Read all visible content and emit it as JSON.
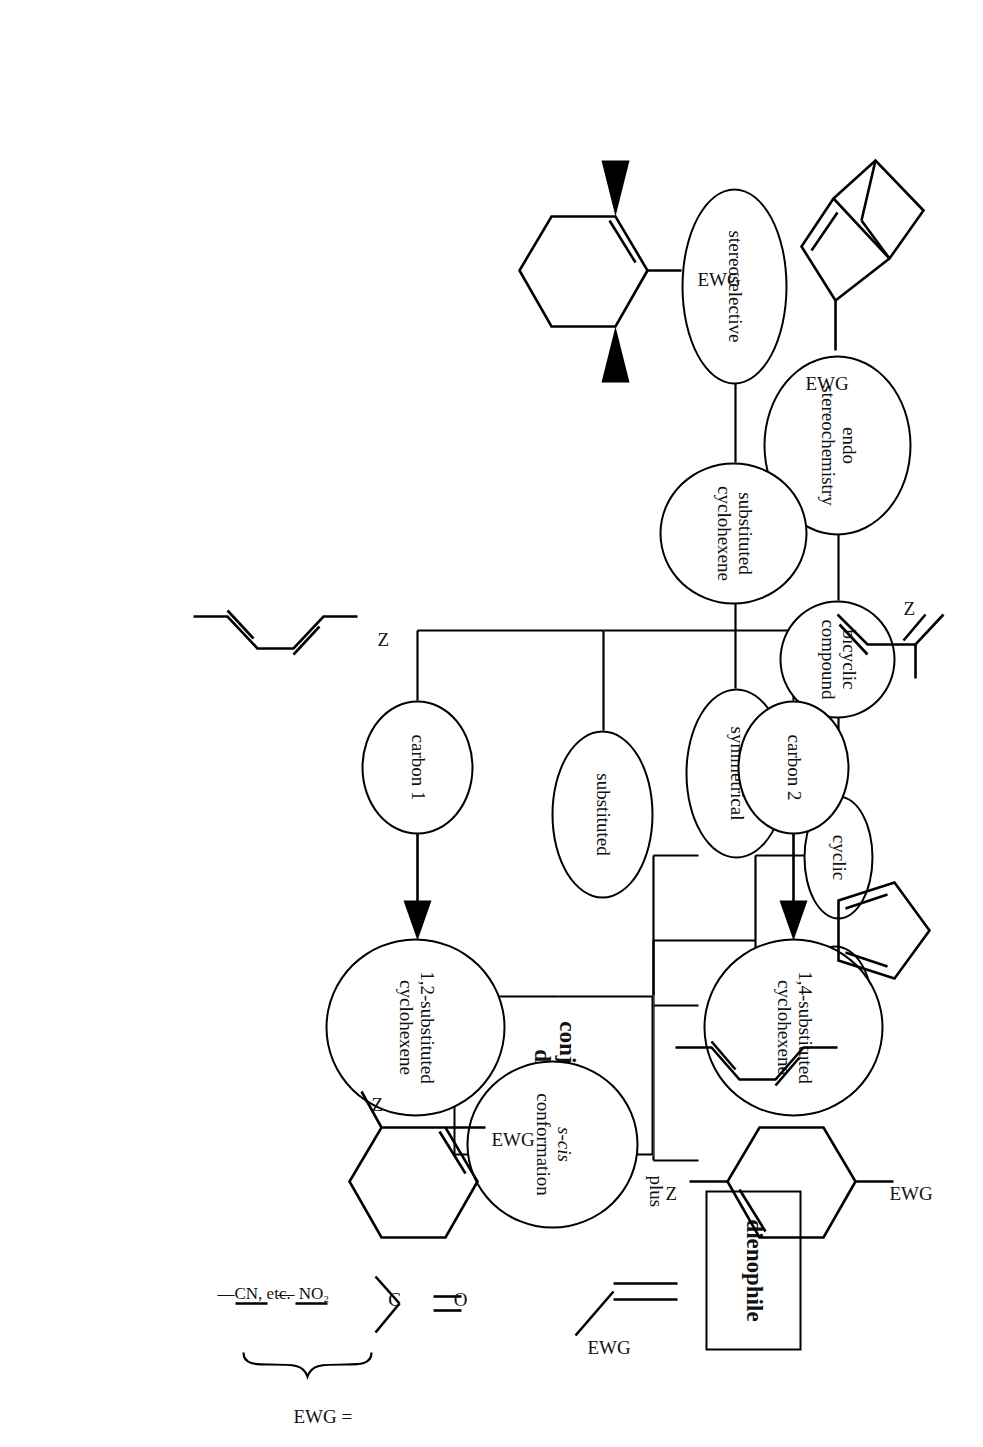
{
  "diagram": {
    "orientation_deg": 90,
    "background": "#ffffff",
    "line_color": "#000000"
  },
  "boxes": [
    {
      "id": "dienophile",
      "label": "dienophile"
    },
    {
      "id": "conjugated_diene",
      "label": "conjugated diene",
      "label_line1": "conjugated",
      "label_line2": "diene"
    }
  ],
  "connector_labels": [
    {
      "id": "plus",
      "label": "plus"
    }
  ],
  "nodes": [
    {
      "id": "s_cis",
      "line1": "s-cis",
      "line2": "conformation",
      "italic_prefix": "s"
    },
    {
      "id": "cyclic",
      "line1": "cyclic",
      "line2": ""
    },
    {
      "id": "acyclic",
      "line1": "acyclic",
      "line2": ""
    },
    {
      "id": "bicyclic_compound",
      "line1": "bicyclic",
      "line2": "compound"
    },
    {
      "id": "endo_stereochemistry",
      "line1": "endo",
      "line2": "stereochemistry"
    },
    {
      "id": "symmetrical",
      "line1": "symmetrical",
      "line2": ""
    },
    {
      "id": "substituted",
      "line1": "substituted",
      "line2": ""
    },
    {
      "id": "substituted_cyclohexene",
      "line1": "substituted",
      "line2": "cyclohexene"
    },
    {
      "id": "stereoselective",
      "line1": "stereoselective",
      "line2": ""
    },
    {
      "id": "carbon_1",
      "line1": "carbon 1",
      "line2": ""
    },
    {
      "id": "carbon_2",
      "line1": "carbon 2",
      "line2": ""
    },
    {
      "id": "product_12",
      "line1": "1,2-substituted",
      "line2": "cyclohexene"
    },
    {
      "id": "product_14",
      "line1": "1,4-substituted",
      "line2": "cyclohexene"
    }
  ],
  "ewg_legend": {
    "prefix": "EWG =",
    "items": [
      {
        "id": "carbonyl",
        "label": "C",
        "double_bond_to": "O"
      },
      {
        "id": "nitro",
        "label": "— NO₂"
      },
      {
        "id": "nitrile",
        "label": "—CN, etc."
      }
    ],
    "carbonyl_c": "C",
    "carbonyl_o": "O"
  },
  "structure_labels": {
    "dienophile_ewg": "EWG",
    "bicyclic_ewg": "EWG",
    "substituted_cyclohexene_ewg": "EWG",
    "diene1_z": "Z",
    "diene2_z": "Z",
    "product12_z": "Z",
    "product12_ewg": "EWG",
    "product14_z": "Z",
    "product14_ewg": "EWG"
  },
  "structures": [
    {
      "id": "cyclopentadiene",
      "name": "cyclopentadiene"
    },
    {
      "id": "hexadiene",
      "name": "2,4-hexadiene"
    },
    {
      "id": "ethylene-ewg",
      "name": "ethylene with EWG"
    },
    {
      "id": "norbornene-ewg",
      "name": "bicyclic norbornene with EWG"
    },
    {
      "id": "cis-disubst-cyclohexene",
      "name": "stereoselective substituted cyclohexene"
    },
    {
      "id": "1-substituted-diene",
      "name": "1-substituted butadiene (Z)"
    },
    {
      "id": "2-substituted-diene",
      "name": "2-substituted butadiene (Z)"
    },
    {
      "id": "product-1-2",
      "name": "1,2-substituted cyclohexene (Z, EWG)"
    },
    {
      "id": "product-1-4",
      "name": "1,4-substituted cyclohexene (Z, EWG)"
    }
  ]
}
